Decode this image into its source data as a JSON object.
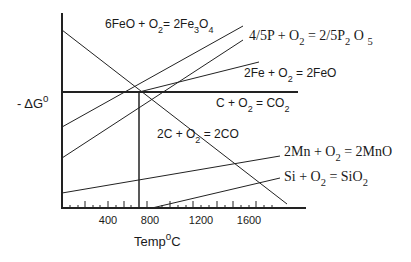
{
  "diagram": {
    "y_axis": {
      "label_prefix": "- ΔG",
      "label_sup": "0"
    },
    "x_axis": {
      "label_main": "Temp",
      "label_sup": "0",
      "label_unit": "C",
      "ticks": [
        {
          "value": "400",
          "x": 108
        },
        {
          "value": "800",
          "x": 147
        },
        {
          "value": "1200",
          "x": 201
        },
        {
          "value": "1600",
          "x": 248
        }
      ]
    },
    "reactions": [
      {
        "id": "feo-fe3o4",
        "parts": [
          "6FeO + O",
          "2",
          "= 2Fe",
          "3",
          "O",
          "4"
        ]
      },
      {
        "id": "p-p2o5",
        "parts": [
          "4/5P + O",
          "2",
          " = 2/5P",
          "2",
          " O ",
          "5"
        ]
      },
      {
        "id": "fe-feo",
        "parts": [
          "2Fe + O",
          "2",
          " = 2FeO"
        ]
      },
      {
        "id": "c-co2",
        "parts": [
          "C + O",
          "2",
          " = CO",
          "2"
        ]
      },
      {
        "id": "c-co",
        "parts": [
          "2C + O",
          "2",
          " = 2CO"
        ]
      },
      {
        "id": "mn-mno",
        "parts": [
          "2Mn + O",
          "2",
          " = 2MnO"
        ]
      },
      {
        "id": "si-sio2",
        "parts": [
          "Si + O",
          "2",
          " = SiO",
          "2"
        ]
      }
    ],
    "colors": {
      "line": "#222222",
      "text": "#1a1a1a",
      "background": "#ffffff"
    }
  }
}
